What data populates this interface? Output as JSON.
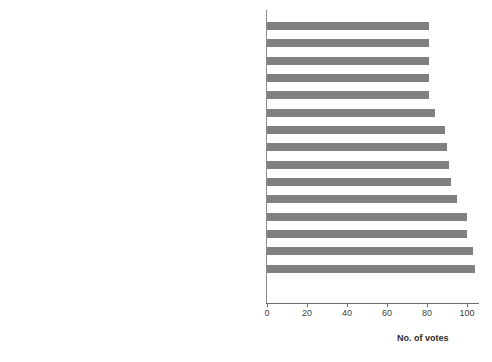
{
  "chart_data": {
    "type": "bar",
    "orientation": "horizontal",
    "title": "",
    "xlabel": "No. of votes",
    "ylabel": "",
    "xlim": [
      0,
      105
    ],
    "xticks": [
      0,
      20,
      40,
      60,
      80,
      100
    ],
    "xtick_labels": [
      "0",
      "20",
      "40",
      "60",
      "80",
      "100"
    ],
    "grid": false,
    "legend": false,
    "bar_color": "#808080",
    "categories": [
      "Regs: Section 77 of Companies Act - financing own share purchase",
      "Regs: Formation and winding up of special purpose vehicles",
      "Disconnect between ownership and management for deals to happen",
      "Available pool of professional entrepreneurs",
      "Evidence: More deals, more exits and successes",
      "Regs: Restrictions on foreign-owned companies raising debt",
      "Tendency of promoters/vendors to hold on",
      "Sweat capital from management",
      "Regs: Take-over threshhold limits",
      "Exit paths - what options are available?",
      "Mindset of lenders; lending against assets and not cashflows",
      "Regs: Insider trading",
      "Incentivizing professional management",
      "Make finance available",
      "Regs: Acqusition finance"
    ],
    "values": [
      81,
      81,
      81,
      81,
      81,
      84,
      89,
      90,
      91,
      92,
      95,
      100,
      100,
      103,
      104
    ]
  }
}
